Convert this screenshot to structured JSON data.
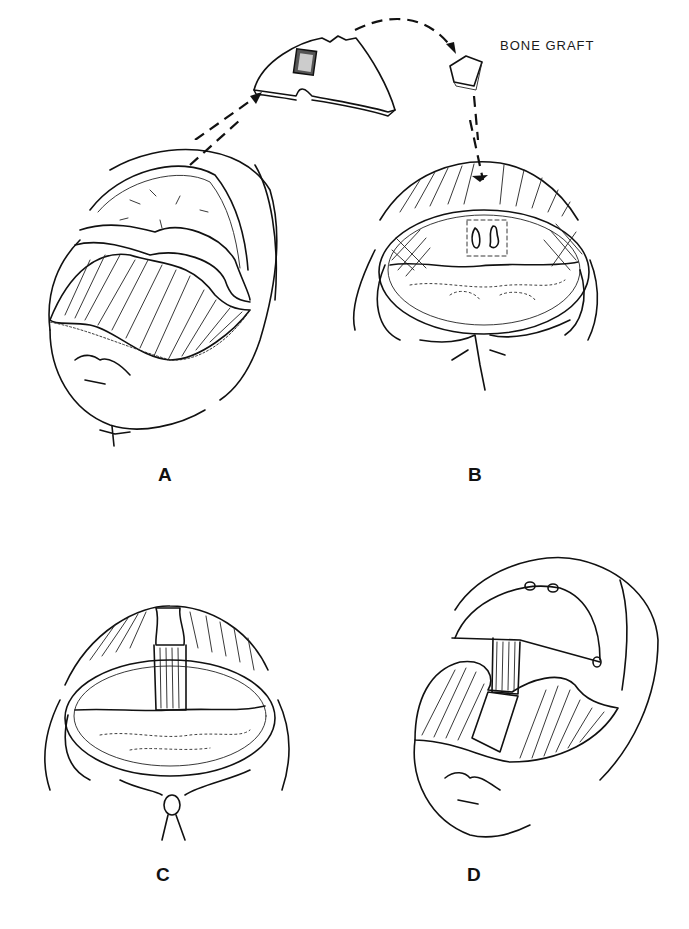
{
  "figure": {
    "annotation": "BONE GRAFT",
    "panels": [
      {
        "id": "A",
        "label": "A"
      },
      {
        "id": "B",
        "label": "B"
      },
      {
        "id": "C",
        "label": "C"
      },
      {
        "id": "D",
        "label": "D"
      }
    ],
    "caption_fragment": ""
  },
  "colors": {
    "ink": "#111111",
    "background": "#ffffff"
  }
}
